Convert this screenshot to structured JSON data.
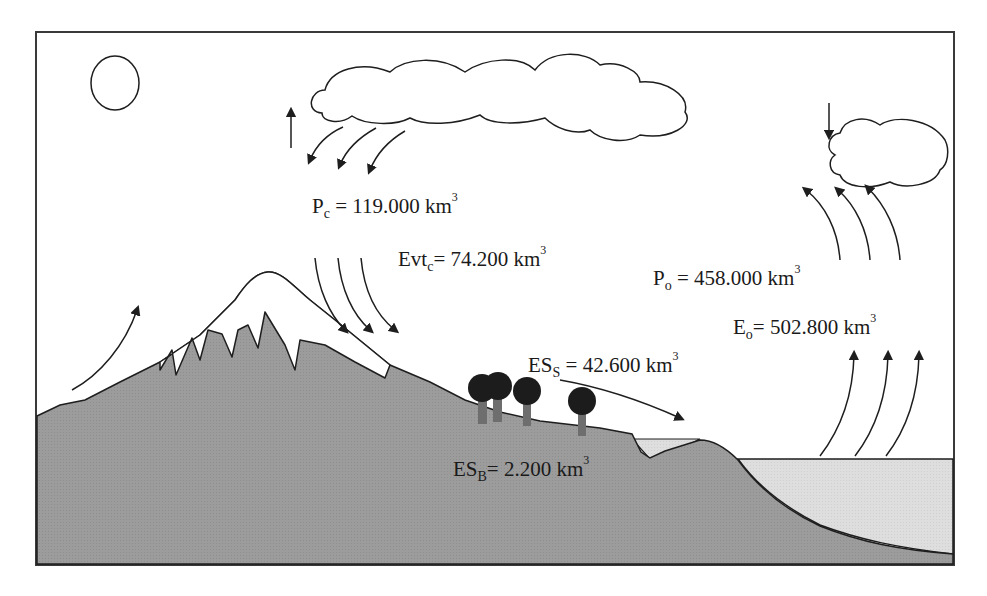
{
  "diagram": {
    "title": "",
    "colors": {
      "frame": "#3a3a3a",
      "land": "#9a9a9a",
      "water": "#dcdcdc",
      "snow": "#ffffff",
      "stroke": "#1e1e1e",
      "tree_crown": "#1c1c1c",
      "tree_trunk": "#6e6e6e"
    },
    "labels": {
      "pc": {
        "symbol": "P",
        "sub": "c",
        "eq": " = ",
        "value": "119.000",
        "unit": "km",
        "exp": "3"
      },
      "evtc": {
        "symbol": "Evt",
        "sub": "c",
        "eq": "= ",
        "value": "74.200",
        "unit": "km",
        "exp": "3"
      },
      "po": {
        "symbol": "P",
        "sub": "o",
        "eq": " = ",
        "value": "458.000",
        "unit": "km",
        "exp": "3"
      },
      "eo": {
        "symbol": "E",
        "sub": "o",
        "eq": "= ",
        "value": "502.800",
        "unit": "km",
        "exp": "3"
      },
      "ess": {
        "symbol": "ES",
        "sub": "S",
        "eq": " = ",
        "value": "42.600",
        "unit": "km",
        "exp": "3"
      },
      "esb": {
        "symbol": "ES",
        "sub": "B",
        "eq": "= ",
        "value": "2.200",
        "unit": "km",
        "exp": "3"
      }
    },
    "elements": [
      "sun",
      "continental-cloud",
      "ocean-cloud",
      "mountain",
      "snow-cap",
      "trees",
      "lake",
      "ocean",
      "precipitation-arrows",
      "evapotranspiration-arrows",
      "ocean-evaporation-arrows",
      "surface-runoff-arrow"
    ]
  }
}
